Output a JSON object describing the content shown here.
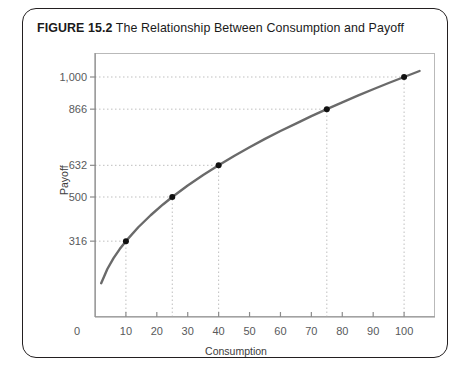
{
  "figure": {
    "label": "FIGURE 15.2",
    "title": "The Relationship Between Consumption and Payoff"
  },
  "colors": {
    "curve": "#6a6a6a",
    "point": "#111111",
    "gridline": "#bfbfbf",
    "axis": "#8c8c8c",
    "frame": "#b9b9b9",
    "border": "#231f20",
    "tick_text": "#58595b"
  },
  "chart_data": {
    "type": "line",
    "title": "The Relationship Between Consumption and Payoff",
    "xlabel": "Consumption",
    "ylabel": "Payoff",
    "xlim": [
      0,
      110
    ],
    "ylim": [
      0,
      1100
    ],
    "grid": true,
    "legend": "none",
    "function": "Payoff = 100 * sqrt(Consumption)",
    "xticks": [
      0,
      10,
      20,
      30,
      40,
      50,
      60,
      70,
      80,
      90,
      100
    ],
    "xtick_labels": [
      "0",
      "10",
      "20",
      "30",
      "40",
      "50",
      "60",
      "70",
      "80",
      "90",
      "100"
    ],
    "yticks": [
      316,
      500,
      632,
      866,
      1000
    ],
    "ytick_labels": [
      "316",
      "500",
      "632",
      "866",
      "1,000"
    ],
    "points": [
      {
        "x": 10,
        "y": 316
      },
      {
        "x": 25,
        "y": 500
      },
      {
        "x": 40,
        "y": 632
      },
      {
        "x": 75,
        "y": 866
      },
      {
        "x": 100,
        "y": 1000
      }
    ],
    "curve": {
      "x": [
        2,
        4,
        6,
        8,
        10,
        14,
        18,
        22,
        25,
        30,
        35,
        40,
        45,
        50,
        55,
        60,
        65,
        70,
        75,
        80,
        85,
        90,
        95,
        100,
        105
      ],
      "y": [
        141,
        200,
        245,
        283,
        316,
        374,
        424,
        469,
        500,
        548,
        592,
        632,
        671,
        707,
        742,
        775,
        806,
        837,
        866,
        894,
        922,
        949,
        975,
        1000,
        1025
      ]
    }
  }
}
